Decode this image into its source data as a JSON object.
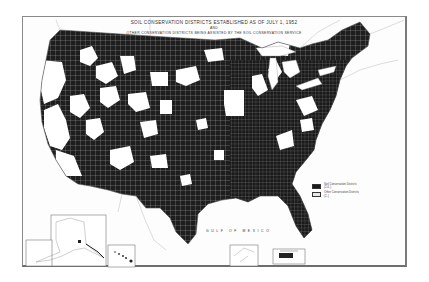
{
  "map": {
    "title": "SOIL CONSERVATION DISTRICTS ESTABLISHED AS OF JULY 1, 1952",
    "title_connector": "AND",
    "subtitle": "OTHER CONSERVATION DISTRICTS BEING ASSISTED BY THE SOIL CONSERVATION SERVICE",
    "water_label": "GULF OF MEXICO",
    "region": "Contiguous United States",
    "insets": [
      "Alaska",
      "Hawaii",
      "Puerto Rico",
      "Virgin Islands"
    ],
    "colors": {
      "districts": "#1a1a1a",
      "county_lines": "#cfcfcf",
      "background": "#ffffff",
      "frame": "#8a8a8a"
    }
  },
  "legend": {
    "items": [
      {
        "label": "Soil Conservation Districts",
        "count": "(2,4..)",
        "swatch": "dark"
      },
      {
        "label": "Other Conservation Districts",
        "count": "(2..)",
        "swatch": "light"
      }
    ]
  }
}
